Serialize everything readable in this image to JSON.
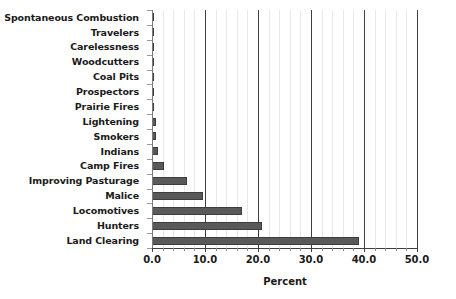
{
  "chart_data": {
    "type": "bar",
    "orientation": "horizontal",
    "title": "",
    "xlabel": "Percent",
    "ylabel": "",
    "xlim": [
      0.0,
      50.0
    ],
    "xticks": [
      "0.0",
      "10.0",
      "20.0",
      "30.0",
      "40.0",
      "50.0"
    ],
    "xtick_values": [
      0,
      10,
      20,
      30,
      40,
      50
    ],
    "minor_tick_step": 2,
    "grid": "vertical",
    "legend": "none",
    "bar_color": "#595959",
    "categories": [
      "Spontaneous Combustion",
      "Travelers",
      "Carelessness",
      "Woodcutters",
      "Coal Pits",
      "Prospectors",
      "Prairie Fires",
      "Lightening",
      "Smokers",
      "Indians",
      "Camp Fires",
      "Improving Pasturage",
      "Malice",
      "Locomotives",
      "Hunters",
      "Land Clearing"
    ],
    "values": [
      0.15,
      0.15,
      0.2,
      0.2,
      0.4,
      0.4,
      0.45,
      0.8,
      0.8,
      1.2,
      2.2,
      6.6,
      9.6,
      17.0,
      20.8,
      39.0
    ]
  }
}
